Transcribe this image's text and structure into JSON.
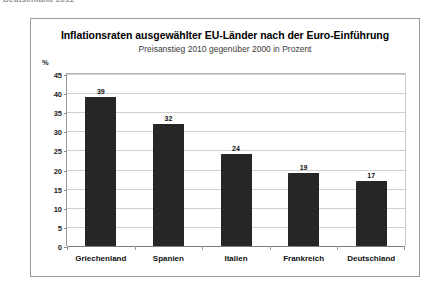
{
  "scan_header": "Deutschland 2011",
  "chart": {
    "title": "Inflationsraten ausgewählter EU-Länder nach der Euro-Einführung",
    "subtitle": "Preisanstieg 2010 gegenüber 2000 in Prozent",
    "unit_label": "%"
  },
  "chart_data": {
    "type": "bar",
    "title": "Inflationsraten ausgewählter EU-Länder nach der Euro-Einführung",
    "subtitle": "Preisanstieg 2010 gegenüber 2000 in Prozent",
    "xlabel": "",
    "ylabel": "%",
    "ylim": [
      0,
      45
    ],
    "ytick_step": 5,
    "yticks": [
      0,
      5,
      10,
      15,
      20,
      25,
      30,
      35,
      40,
      45
    ],
    "ytick_labels": [
      "0",
      "5",
      "10",
      "15",
      "20",
      "25",
      "30",
      "35",
      "40",
      "45"
    ],
    "grid": true,
    "legend": false,
    "bar_color": "#262626",
    "categories": [
      "Griechenland",
      "Spanien",
      "Italien",
      "Frankreich",
      "Deutschland"
    ],
    "values": [
      39,
      32,
      24,
      19,
      17
    ],
    "value_labels": [
      "39",
      "32",
      "24",
      "19",
      "17"
    ]
  }
}
